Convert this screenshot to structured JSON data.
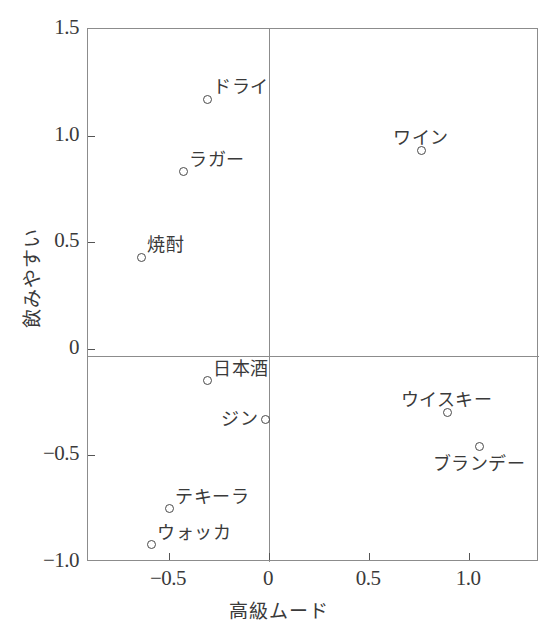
{
  "chart_data": {
    "type": "scatter",
    "title": "",
    "xlabel": "高級ムード",
    "ylabel": "飲みやすい",
    "xlim": [
      -0.905,
      1.35
    ],
    "ylim": [
      -1.0,
      1.5
    ],
    "grid": false,
    "legend": null,
    "xticks": [
      {
        "value": -0.5,
        "label": "−0.5"
      },
      {
        "value": 0,
        "label": "0"
      },
      {
        "value": 0.5,
        "label": "0.5"
      },
      {
        "value": 1.0,
        "label": "1.0"
      }
    ],
    "yticks": [
      {
        "value": 1.5,
        "label": "1.5"
      },
      {
        "value": 1.0,
        "label": "1.0"
      },
      {
        "value": 0.5,
        "label": "0.5"
      },
      {
        "value": 0,
        "label": "0"
      },
      {
        "value": -0.5,
        "label": "−0.5"
      },
      {
        "value": -1.0,
        "label": "−1.0"
      }
    ],
    "points": [
      {
        "label": "ドライ",
        "x": -0.31,
        "y": 1.17,
        "label_pos": "upper-right"
      },
      {
        "label": "ワイン",
        "x": 0.76,
        "y": 0.93,
        "label_pos": "above"
      },
      {
        "label": "ラガー",
        "x": -0.43,
        "y": 0.83,
        "label_pos": "upper-right"
      },
      {
        "label": "焼酎",
        "x": -0.64,
        "y": 0.43,
        "label_pos": "upper-right"
      },
      {
        "label": "日本酒",
        "x": -0.31,
        "y": -0.15,
        "label_pos": "upper-right"
      },
      {
        "label": "ジン",
        "x": -0.02,
        "y": -0.33,
        "label_pos": "left"
      },
      {
        "label": "ウイスキー",
        "x": 0.89,
        "y": -0.3,
        "label_pos": "above"
      },
      {
        "label": "ブランデー",
        "x": 1.05,
        "y": -0.46,
        "label_pos": "below"
      },
      {
        "label": "テキーラ",
        "x": -0.5,
        "y": -0.75,
        "label_pos": "upper-right"
      },
      {
        "label": "ウォッカ",
        "x": -0.59,
        "y": -0.92,
        "label_pos": "upper-right"
      }
    ]
  }
}
